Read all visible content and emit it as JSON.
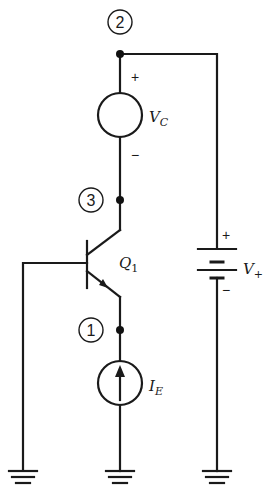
{
  "diagram": {
    "type": "circuit-schematic",
    "nodes": [
      {
        "id": "node-2",
        "label": "2"
      },
      {
        "id": "node-3",
        "label": "3"
      },
      {
        "id": "node-1",
        "label": "1"
      }
    ],
    "components": {
      "vc": {
        "name": "V",
        "subscript": "C",
        "plus": "+",
        "minus": "−"
      },
      "q1": {
        "name": "Q",
        "subscript": "1"
      },
      "ie": {
        "name": "I",
        "subscript": "E"
      },
      "vplus": {
        "name": "V",
        "subscript": "+",
        "plus": "+",
        "minus": "−"
      }
    },
    "grounds": [
      "ground-base",
      "ground-current-source",
      "ground-supply"
    ]
  }
}
